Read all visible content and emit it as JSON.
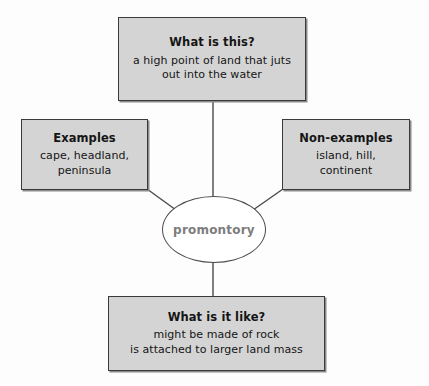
{
  "diagram": {
    "type": "concept-map",
    "title": "",
    "center": {
      "term": "promontory",
      "shape": "ellipse",
      "text_color": "#7d7d7d"
    },
    "colors": {
      "box_fill": "#d4d4d4",
      "box_border": "#3a3a3a",
      "center_fill": "#ffffff",
      "center_border": "#4a4a4a",
      "connector": "#4a4a4a",
      "page_background": "#ffffff",
      "text": "#151515"
    },
    "nodes": [
      {
        "id": "definition",
        "title": "What is this?",
        "body": "a high point of land that juts\nout into the water",
        "position": "top"
      },
      {
        "id": "examples",
        "title": "Examples",
        "body": "cape, headland,\npeninsula",
        "position": "left"
      },
      {
        "id": "non-examples",
        "title": "Non-examples",
        "body": "island, hill,\ncontinent",
        "position": "right"
      },
      {
        "id": "characteristics",
        "title": "What is it like?",
        "body": "might be made of rock\nis attached to larger land mass",
        "position": "bottom"
      }
    ],
    "connectors": [
      {
        "from": "definition",
        "to": "center",
        "style": "vertical-line"
      },
      {
        "from": "examples",
        "to": "center",
        "style": "diagonal-line"
      },
      {
        "from": "non-examples",
        "to": "center",
        "style": "diagonal-line"
      },
      {
        "from": "characteristics",
        "to": "center",
        "style": "vertical-line"
      }
    ]
  }
}
